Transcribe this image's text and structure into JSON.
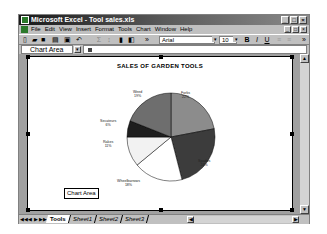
{
  "window": {
    "title": "Microsoft Excel - Tool sales.xls",
    "controls": [
      "_",
      "□",
      "×"
    ]
  },
  "menubar": {
    "items": [
      "File",
      "Edit",
      "View",
      "Insert",
      "Format",
      "Tools",
      "Chart",
      "Window",
      "Help"
    ],
    "doc_controls": [
      "_",
      "□",
      "×"
    ]
  },
  "toolbar": {
    "font_name": "Arial",
    "font_size": "10",
    "bold_label": "B",
    "italic_label": "I",
    "underline_label": "U"
  },
  "name_box": {
    "value": "Chart Area"
  },
  "tooltip": {
    "text": "Chart Area"
  },
  "sheet_tabs": {
    "tabs": [
      "Tools",
      "Sheet1",
      "Sheet2",
      "Sheet3"
    ],
    "active": "Tools"
  },
  "chart_data": {
    "type": "pie",
    "title": "SALES OF GARDEN TOOLS",
    "categories": [
      "Forks",
      "Spades",
      "Wheelbarrows",
      "Rakes",
      "Secateurs",
      "Weed"
    ],
    "values": [
      22,
      24,
      18,
      11,
      6,
      19
    ],
    "labels": [
      "Forks 22%",
      "Spades 24%",
      "Wheelbarrows 18%",
      "Rakes 11%",
      "Secateurs 6%",
      "Weed 19%"
    ],
    "colors": [
      "#8c8c8c",
      "#3c3c3c",
      "#ffffff",
      "#f2f2f2",
      "#1e1e1e",
      "#6e6e6e"
    ],
    "legend": "none",
    "grid": false
  },
  "pie_labels": {
    "forks": {
      "name": "Forks",
      "pct": "22%"
    },
    "spades": {
      "name": "Spades",
      "pct": "24%"
    },
    "wheelbarrows": {
      "name": "Wheelbarrows",
      "pct": "18%"
    },
    "rakes": {
      "name": "Rakes",
      "pct": "11%"
    },
    "secateurs": {
      "name": "Secateurs",
      "pct": "6%"
    },
    "weed": {
      "name": "Weed",
      "pct": "19%"
    }
  }
}
